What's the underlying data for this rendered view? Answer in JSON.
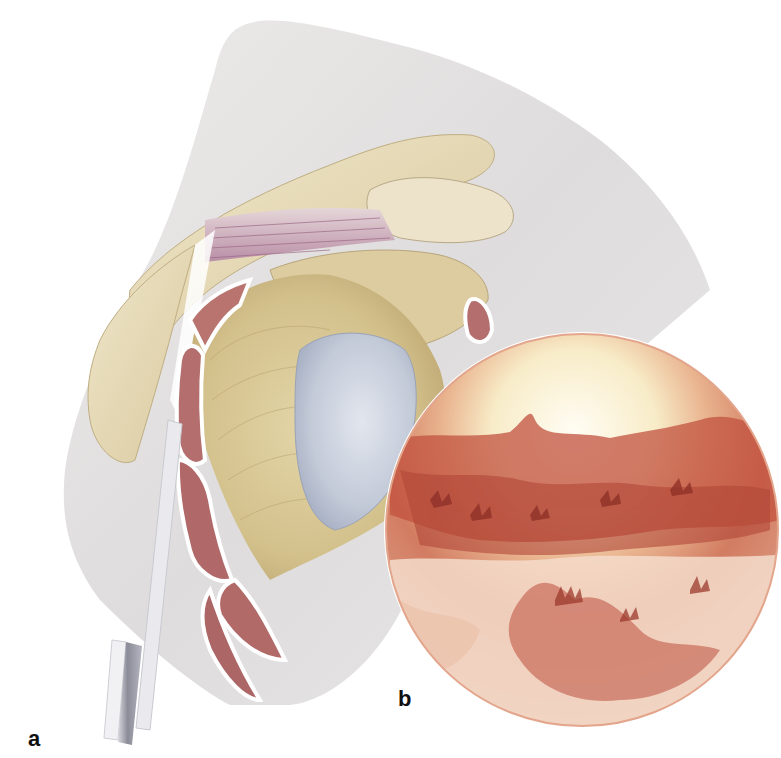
{
  "figure": {
    "panels": [
      {
        "id": "a",
        "label": "a",
        "content": "anatomical-illustration-shoulder-joint-lateral-view-with-arthroscope"
      },
      {
        "id": "b",
        "label": "b",
        "content": "arthroscopic-view-circular-inset"
      }
    ],
    "colors": {
      "background": "#ffffff",
      "skin": "#e4e2e2",
      "bone": "#e6dcbc",
      "bone_shadow": "#cfc095",
      "humeral_head": "#d9c996",
      "cartilage": "#c9ced9",
      "muscle": "#b46e6e",
      "tendon": "#c7a8bd",
      "arthroscope": "#a8a8b4",
      "inset_light": "#fbf3de",
      "inset_tissue": "#c0503f",
      "inset_edge": "#d98a72",
      "label_text": "#111111"
    }
  }
}
